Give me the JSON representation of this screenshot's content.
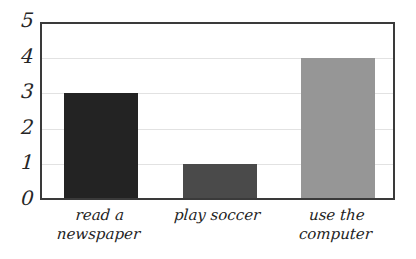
{
  "chart_data": {
    "type": "bar",
    "title": "",
    "subtitle": "",
    "xlabel": "",
    "ylabel": "",
    "categories": [
      "read a\nnewspaper",
      "play soccer",
      "use the\ncomputer"
    ],
    "values": [
      3,
      1,
      4
    ],
    "series": [
      {
        "name": "",
        "values": [
          3,
          1,
          4
        ]
      }
    ],
    "bar_colors": [
      "#232323",
      "#4a4a4a",
      "#969696"
    ],
    "ylim": [
      0,
      5
    ],
    "ytick_labels": [
      "0",
      "1",
      "2",
      "3",
      "4",
      "5"
    ],
    "ytick_values": [
      0,
      1,
      2,
      3,
      4,
      5
    ],
    "grid": true,
    "legend": false,
    "legend_position": "none"
  },
  "style": {
    "background": "#ffffff",
    "frame_color": "#3a3a3a",
    "gridline_color": "#e2e2e2",
    "tick_text_color": "#262626",
    "label_text_color": "#222222"
  }
}
